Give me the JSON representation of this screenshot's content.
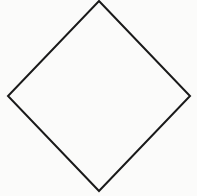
{
  "diagram": {
    "shape": "diamond",
    "label": "",
    "stroke_color": "#1a1a1a",
    "fill_color": "#fbfbfa",
    "background_color": "#fbfbfa",
    "stroke_width": 2,
    "vertices": {
      "top": [
        99,
        1
      ],
      "right": [
        190,
        96
      ],
      "bottom": [
        99,
        191
      ],
      "left": [
        8,
        96
      ]
    }
  }
}
